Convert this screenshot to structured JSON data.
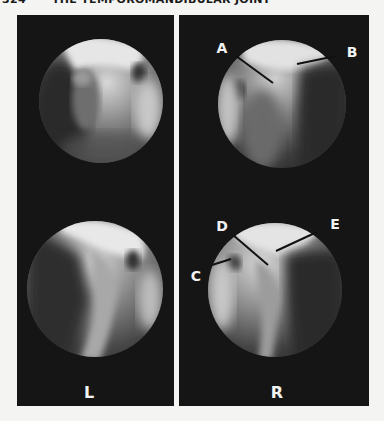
{
  "page": {
    "page_number": "324",
    "running_head": "THE TEMPOROMANDIBULAR JOINT"
  },
  "figure": {
    "panels": [
      {
        "id": "left",
        "side_label": "L",
        "views": [
          {
            "position": "top",
            "labels": []
          },
          {
            "position": "bottom",
            "labels": []
          }
        ]
      },
      {
        "id": "right",
        "side_label": "R",
        "views": [
          {
            "position": "top",
            "labels": [
              {
                "text": "A"
              },
              {
                "text": "B"
              }
            ]
          },
          {
            "position": "bottom",
            "labels": [
              {
                "text": "C"
              },
              {
                "text": "D"
              },
              {
                "text": "E"
              }
            ]
          }
        ]
      }
    ],
    "colors": {
      "panel_background": "#151515",
      "label_color": "#f2f2f2",
      "pointer_line": "#111111",
      "page_background": "#f4f4f2"
    }
  }
}
